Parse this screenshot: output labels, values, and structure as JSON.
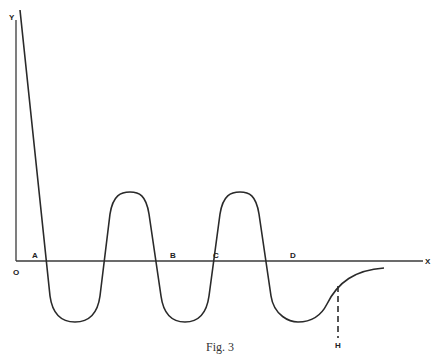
{
  "figure": {
    "caption": "Fig. 3",
    "axes": {
      "y_label": "Y",
      "x_label": "X",
      "origin_label": "O"
    },
    "point_labels": {
      "A": "A",
      "B": "B",
      "C": "C",
      "D": "D",
      "H": "H"
    },
    "colors": {
      "line": "#2a2a2a",
      "axis": "#3a3a3a",
      "background": "#ffffff"
    }
  }
}
